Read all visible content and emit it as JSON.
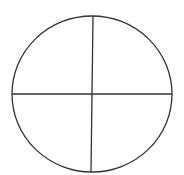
{
  "diagram": {
    "stroke_color": "#333333",
    "background": "#ffffff",
    "circle": {
      "cx": 92,
      "cy": 94,
      "rx": 80,
      "ry": 78
    },
    "horizontal_line": {
      "x1": 12,
      "y1": 94,
      "x2": 172,
      "y2": 94
    },
    "vertical_line": {
      "x1": 93,
      "y1": 16,
      "x2": 91,
      "y2": 172
    }
  }
}
